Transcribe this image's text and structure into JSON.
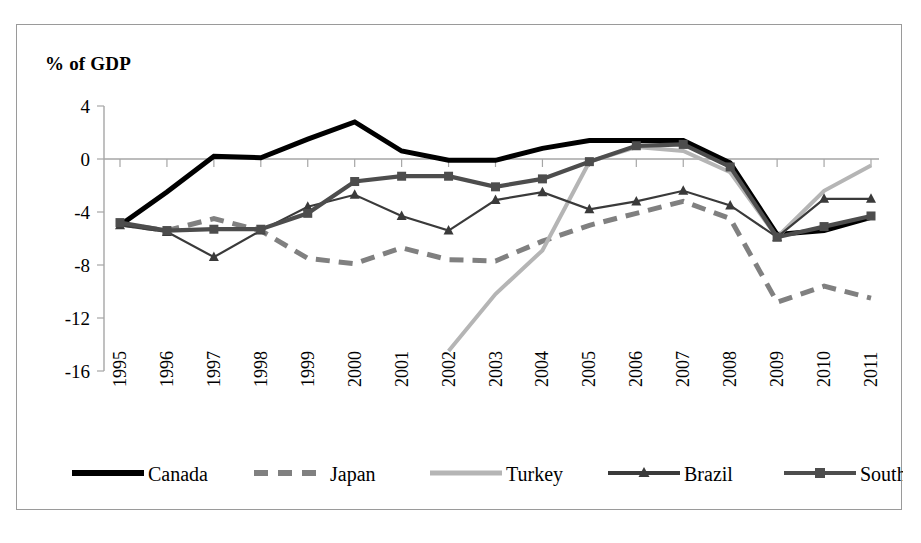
{
  "chart": {
    "axis_title": "% of GDP",
    "border_color": "#9a9a9a"
  },
  "chart_data": {
    "type": "line",
    "title": "",
    "subtitle": "",
    "xlabel": "",
    "ylabel": "% of GDP",
    "ylim": [
      -16,
      4
    ],
    "yticks": [
      4,
      0,
      -4,
      -8,
      -12,
      -16
    ],
    "ytick_labels": [
      "4",
      "0",
      "-4",
      "-8",
      "-12",
      "-16"
    ],
    "grid": false,
    "legend_position": "bottom",
    "categories": [
      "1995",
      "1996",
      "1997",
      "1998",
      "1999",
      "2000",
      "2001",
      "2002",
      "2003",
      "2004",
      "2005",
      "2006",
      "2007",
      "2008",
      "2009",
      "2010",
      "2011"
    ],
    "x": [
      1995,
      1996,
      1997,
      1998,
      1999,
      2000,
      2001,
      2002,
      2003,
      2004,
      2005,
      2006,
      2007,
      2008,
      2009,
      2010,
      2011
    ],
    "series": [
      {
        "name": "Canada",
        "color": "#000000",
        "style": "solid",
        "width": 5.0,
        "marker": "none",
        "values": [
          -5.0,
          -2.5,
          0.2,
          0.1,
          1.5,
          2.8,
          0.6,
          -0.1,
          -0.1,
          0.8,
          1.4,
          1.4,
          1.4,
          -0.3,
          -5.7,
          -5.4,
          -4.4
        ]
      },
      {
        "name": "Japan",
        "color": "#808080",
        "style": "dashed",
        "width": 5.0,
        "marker": "none",
        "values": [
          -4.9,
          -5.4,
          -4.5,
          -5.4,
          -7.5,
          -7.9,
          -6.7,
          -7.6,
          -7.7,
          -6.2,
          -5.0,
          -4.1,
          -3.2,
          -4.5,
          -10.8,
          -9.6,
          -10.5
        ]
      },
      {
        "name": "Turkey",
        "color": "#b5b5b5",
        "style": "solid",
        "width": 4.0,
        "marker": "none",
        "values": [
          null,
          null,
          null,
          null,
          null,
          null,
          null,
          -14.5,
          -10.2,
          -6.9,
          -0.2,
          0.9,
          0.6,
          -1.0,
          -5.9,
          -2.4,
          -0.5
        ]
      },
      {
        "name": "Brazil",
        "color": "#3a3a3a",
        "style": "solid",
        "width": 2.2,
        "marker": "triangle",
        "values": [
          -5.0,
          -5.5,
          -7.4,
          -5.4,
          -3.6,
          -2.7,
          -4.3,
          -5.4,
          -3.1,
          -2.5,
          -3.8,
          -3.2,
          -2.4,
          -3.5,
          -5.9,
          -3.0,
          -3.0
        ]
      },
      {
        "name": "South Africa",
        "color": "#4d4d4d",
        "style": "solid",
        "width": 4.2,
        "marker": "square",
        "values": [
          -4.8,
          -5.4,
          -5.3,
          -5.3,
          -4.1,
          -1.7,
          -1.3,
          -1.3,
          -2.1,
          -1.5,
          -0.2,
          1.0,
          1.1,
          -0.6,
          -5.9,
          -5.1,
          -4.3
        ]
      }
    ],
    "legend": [
      {
        "label": "Canada",
        "color": "#000000",
        "style": "solid",
        "marker": "none"
      },
      {
        "label": "Japan",
        "color": "#808080",
        "style": "dashed",
        "marker": "none"
      },
      {
        "label": "Turkey",
        "color": "#b5b5b5",
        "style": "solid",
        "marker": "none"
      },
      {
        "label": "Brazil",
        "color": "#3a3a3a",
        "style": "solid",
        "marker": "triangle"
      },
      {
        "label": "South Africa",
        "color": "#4d4d4d",
        "style": "solid",
        "marker": "square"
      }
    ]
  }
}
